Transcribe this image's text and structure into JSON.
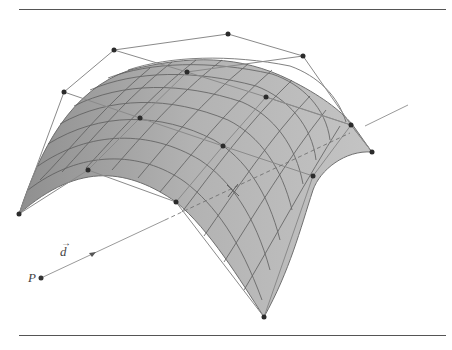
{
  "figure": {
    "labels": {
      "point": "P",
      "direction": "d"
    },
    "colors": {
      "surface_fill": "#a9a9a9",
      "surface_edge": "#6f6f6f",
      "grid": "#5a5a5a",
      "control_net": "#8a8a8a",
      "control_point": "#2b2b2b",
      "ray": "#9a9a9a",
      "rule": "#555555"
    },
    "control_points": [
      [
        [
          19,
          214
        ],
        [
          64,
          92
        ],
        [
          114,
          50
        ],
        [
          228,
          34
        ]
      ],
      [
        [
          88,
          170
        ],
        [
          140,
          118
        ],
        [
          187,
          72
        ],
        [
          303,
          56
        ]
      ],
      [
        [
          176,
          202
        ],
        [
          223,
          146
        ],
        [
          266,
          97
        ],
        [
          351,
          125
        ]
      ],
      [
        [
          264,
          317
        ],
        [
          313,
          176
        ],
        [
          351,
          125
        ],
        [
          372,
          152
        ]
      ]
    ],
    "ray": {
      "origin": [
        41,
        278
      ],
      "end": [
        408,
        105
      ],
      "arrow_at": [
        93,
        253
      ]
    },
    "intersection_mark": [
      233,
      190
    ]
  }
}
